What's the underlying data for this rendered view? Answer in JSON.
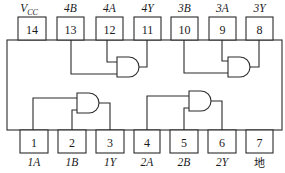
{
  "figure": {
    "colors": {
      "line": "#2a2a2a",
      "text": "#1a1a1a",
      "background": "#ffffff"
    }
  },
  "top_pins": [
    {
      "number": "14",
      "label_main": "V",
      "label_sub": "CC"
    },
    {
      "number": "13",
      "label": "4B"
    },
    {
      "number": "12",
      "label": "4A"
    },
    {
      "number": "11",
      "label": "4Y"
    },
    {
      "number": "10",
      "label": "3B"
    },
    {
      "number": "9",
      "label": "3A"
    },
    {
      "number": "8",
      "label": "3Y"
    }
  ],
  "bottom_pins": [
    {
      "number": "1",
      "label": "1A"
    },
    {
      "number": "2",
      "label": "1B"
    },
    {
      "number": "3",
      "label": "1Y"
    },
    {
      "number": "4",
      "label": "2A"
    },
    {
      "number": "5",
      "label": "2B"
    },
    {
      "number": "6",
      "label": "2Y"
    },
    {
      "number": "7",
      "label": "地"
    }
  ],
  "gates": [
    {
      "name": "gate-1",
      "type": "AND",
      "inputs": [
        "1",
        "2"
      ],
      "output": "3"
    },
    {
      "name": "gate-2",
      "type": "AND",
      "inputs": [
        "4",
        "5"
      ],
      "output": "6"
    },
    {
      "name": "gate-3",
      "type": "AND",
      "inputs": [
        "10",
        "9"
      ],
      "output": "8"
    },
    {
      "name": "gate-4",
      "type": "AND",
      "inputs": [
        "13",
        "12"
      ],
      "output": "11"
    }
  ]
}
